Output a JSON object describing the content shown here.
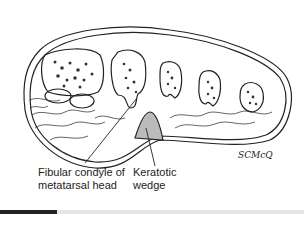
{
  "figure": {
    "labels": {
      "fibular_condyle": "Fibular condyle of\nmetatarsal head",
      "keratotic_wedge": "Keratotic\nwedge"
    },
    "signature": "SCMcQ"
  },
  "colors": {
    "line": "#222222",
    "background": "#ffffff",
    "bone_speckle": "#333333",
    "bar_dark": "#222222",
    "bar_light": "#e6e6e6"
  }
}
